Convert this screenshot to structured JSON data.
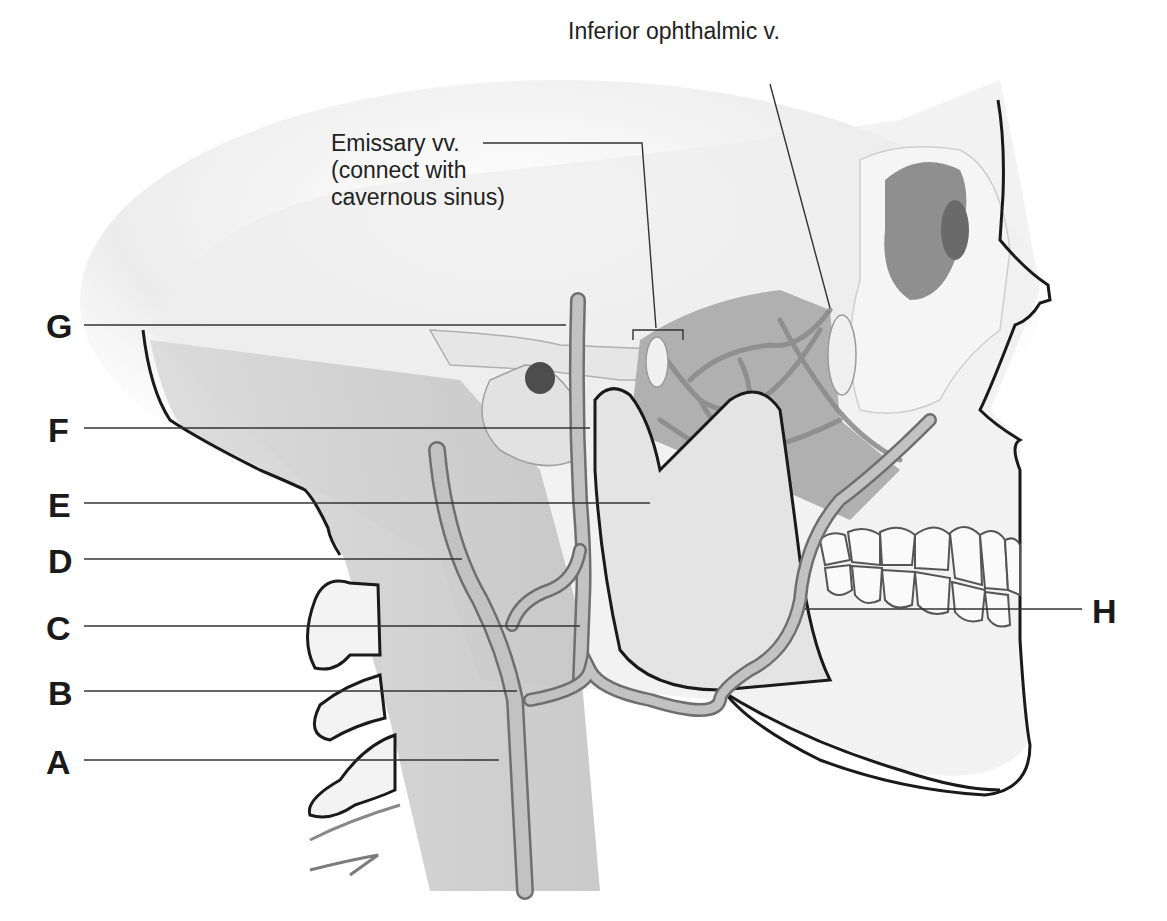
{
  "diagram": {
    "colors": {
      "background": "#ffffff",
      "outline": "#1a1a1a",
      "bone_light": "#f2f2f2",
      "bone_mid": "#d9d9d9",
      "bone_dark": "#a8a8a8",
      "vein_fill": "#b5b5b5",
      "vein_edge": "#7a7a7a",
      "leader_line": "#333333",
      "label_text": "#1a1a1a"
    },
    "top_labels": [
      {
        "id": "inferior-ophthalmic",
        "lines": [
          "Inferior ophthalmic v."
        ],
        "x": 568,
        "y": 32,
        "leader": [
          [
            770,
            84
          ],
          [
            830,
            308
          ]
        ]
      },
      {
        "id": "emissary",
        "lines": [
          "Emissary vv.",
          "(connect with",
          "cavernous sinus)"
        ],
        "x": 331,
        "y": 116,
        "leader": [
          [
            483,
            143
          ],
          [
            642,
            143
          ],
          [
            656,
            328
          ]
        ],
        "bracket": [
          [
            633,
            340
          ],
          [
            633,
            330
          ],
          [
            683,
            330
          ],
          [
            683,
            340
          ]
        ]
      }
    ],
    "letter_labels": [
      {
        "letter": "G",
        "x": 46,
        "y": 311,
        "line_y": 325,
        "line_x2": 566
      },
      {
        "letter": "F",
        "x": 46,
        "y": 415,
        "line_y": 428,
        "line_x2": 590
      },
      {
        "letter": "E",
        "x": 46,
        "y": 490,
        "line_y": 503,
        "line_x2": 650
      },
      {
        "letter": "D",
        "x": 46,
        "y": 546,
        "line_y": 559,
        "line_x2": 462
      },
      {
        "letter": "C",
        "x": 46,
        "y": 613,
        "line_y": 626,
        "line_x2": 580
      },
      {
        "letter": "B",
        "x": 46,
        "y": 678,
        "line_y": 691,
        "line_x2": 517
      },
      {
        "letter": "A",
        "x": 46,
        "y": 748,
        "line_y": 760,
        "line_x2": 499
      },
      {
        "letter": "H",
        "x": 1090,
        "y": 594,
        "line_y": 609,
        "line_x1": 805,
        "line_x2": 1082,
        "side": "right"
      }
    ]
  }
}
